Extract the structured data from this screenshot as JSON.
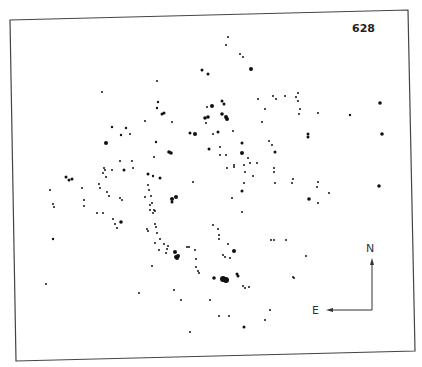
{
  "plate": {
    "number": "628"
  },
  "compass": {
    "north_label": "N",
    "east_label": "E"
  },
  "colors": {
    "ink": "#111111",
    "frame": "#444444",
    "background": "#ffffff"
  },
  "stars": [
    [
      228,
      37,
      1
    ],
    [
      226,
      45,
      1
    ],
    [
      240,
      54,
      1
    ],
    [
      243,
      57,
      1
    ],
    [
      251,
      69,
      2
    ],
    [
      202,
      70,
      1.5
    ],
    [
      208,
      74,
      1.5
    ],
    [
      157,
      81,
      1
    ],
    [
      102,
      92,
      1
    ],
    [
      158,
      102,
      1.2
    ],
    [
      157,
      108,
      1.2
    ],
    [
      162,
      114,
      1.5
    ],
    [
      164,
      113,
      1.5
    ],
    [
      145,
      121,
      1
    ],
    [
      172,
      122,
      1
    ],
    [
      212,
      106,
      2
    ],
    [
      222,
      101,
      1.5
    ],
    [
      224,
      104,
      1.5
    ],
    [
      207,
      107,
      1
    ],
    [
      208,
      117,
      1.8
    ],
    [
      205,
      118,
      1.8
    ],
    [
      222,
      114,
      1.8
    ],
    [
      226,
      117,
      2
    ],
    [
      227,
      119,
      2
    ],
    [
      206,
      123,
      1
    ],
    [
      218,
      132,
      1.5
    ],
    [
      190,
      133,
      1.5
    ],
    [
      195,
      134,
      2
    ],
    [
      213,
      134,
      1
    ],
    [
      233,
      131,
      1
    ],
    [
      242,
      143,
      1.5
    ],
    [
      258,
      99,
      1
    ],
    [
      265,
      109,
      1
    ],
    [
      262,
      122,
      1
    ],
    [
      273,
      96,
      1
    ],
    [
      276,
      99,
      1
    ],
    [
      156,
      142,
      1.2
    ],
    [
      154,
      157,
      1
    ],
    [
      171,
      153,
      1.8
    ],
    [
      169,
      152,
      1.8
    ],
    [
      209,
      149,
      1.5
    ],
    [
      220,
      147,
      1
    ],
    [
      220,
      155,
      1
    ],
    [
      226,
      155,
      1
    ],
    [
      242,
      153,
      2
    ],
    [
      248,
      158,
      1
    ],
    [
      250,
      163,
      1
    ],
    [
      234,
      167,
      1
    ],
    [
      275,
      152,
      1.5
    ],
    [
      274,
      168,
      1
    ],
    [
      269,
      141,
      1
    ],
    [
      272,
      145,
      1
    ],
    [
      112,
      127,
      1.2
    ],
    [
      126,
      128,
      1.2
    ],
    [
      121,
      135,
      1.2
    ],
    [
      130,
      134,
      1
    ],
    [
      106,
      143,
      2
    ],
    [
      120,
      161,
      1
    ],
    [
      132,
      161,
      1
    ],
    [
      133,
      168,
      1
    ],
    [
      105,
      170,
      1
    ],
    [
      112,
      170,
      1
    ],
    [
      124,
      170,
      1.5
    ],
    [
      106,
      177,
      1
    ],
    [
      66,
      177,
      1.5
    ],
    [
      69,
      180,
      1.5
    ],
    [
      72,
      179,
      1.5
    ],
    [
      148,
      174,
      1.5
    ],
    [
      50,
      190,
      1
    ],
    [
      53,
      204,
      1
    ],
    [
      54,
      207,
      1
    ],
    [
      82,
      188,
      1
    ],
    [
      84,
      200,
      1
    ],
    [
      84,
      206,
      1
    ],
    [
      99,
      184,
      1
    ],
    [
      100,
      188,
      1
    ],
    [
      103,
      173,
      1
    ],
    [
      104,
      168,
      1
    ],
    [
      107,
      192,
      1
    ],
    [
      109,
      196,
      1
    ],
    [
      97,
      213,
      1
    ],
    [
      103,
      213,
      1
    ],
    [
      120,
      198,
      1
    ],
    [
      122,
      200,
      1
    ],
    [
      121,
      222,
      1.8
    ],
    [
      117,
      228,
      1
    ],
    [
      148,
      185,
      1
    ],
    [
      149,
      190,
      1
    ],
    [
      145,
      197,
      1
    ],
    [
      150,
      205,
      1
    ],
    [
      150,
      210,
      1
    ],
    [
      153,
      213,
      1
    ],
    [
      154,
      210,
      1
    ],
    [
      53,
      239,
      1.2
    ],
    [
      113,
      219,
      1
    ],
    [
      115,
      224,
      1
    ],
    [
      153,
      176,
      1.2
    ],
    [
      160,
      178,
      1.5
    ],
    [
      151,
      196,
      1
    ],
    [
      152,
      203,
      1
    ],
    [
      155,
      211,
      1
    ],
    [
      155,
      224,
      1
    ],
    [
      172,
      199,
      2
    ],
    [
      176,
      197,
      2
    ],
    [
      172,
      202,
      1.5
    ],
    [
      147,
      229,
      1
    ],
    [
      148,
      231,
      1
    ],
    [
      155,
      243,
      1
    ],
    [
      156,
      227,
      1
    ],
    [
      157,
      233,
      1
    ],
    [
      160,
      239,
      1
    ],
    [
      159,
      250,
      1
    ],
    [
      167,
      249,
      1
    ],
    [
      175,
      252,
      2
    ],
    [
      176,
      257,
      2
    ],
    [
      187,
      247,
      1
    ],
    [
      195,
      250,
      1
    ],
    [
      213,
      225,
      1
    ],
    [
      218,
      229,
      1
    ],
    [
      219,
      239,
      1
    ],
    [
      219,
      235,
      1
    ],
    [
      228,
      244,
      1
    ],
    [
      223,
      255,
      1
    ],
    [
      225,
      257,
      1
    ],
    [
      234,
      165,
      1
    ],
    [
      227,
      168,
      1
    ],
    [
      244,
      165,
      1
    ],
    [
      245,
      172,
      1
    ],
    [
      253,
      176,
      1
    ],
    [
      257,
      163,
      1
    ],
    [
      274,
      172,
      1
    ],
    [
      275,
      183,
      1
    ],
    [
      244,
      183,
      1
    ],
    [
      242,
      191,
      1.5
    ],
    [
      232,
      198,
      1
    ],
    [
      242,
      212,
      1
    ],
    [
      286,
      240,
      1
    ],
    [
      193,
      182,
      1
    ],
    [
      164,
      244,
      1
    ],
    [
      168,
      246,
      1
    ],
    [
      166,
      253,
      1
    ],
    [
      177,
      258,
      2
    ],
    [
      178,
      256,
      2
    ],
    [
      189,
      247,
      1
    ],
    [
      152,
      266,
      1
    ],
    [
      196,
      259,
      1
    ],
    [
      196,
      267,
      1
    ],
    [
      198,
      271,
      1
    ],
    [
      199,
      273,
      1
    ],
    [
      214,
      278,
      1.8
    ],
    [
      223,
      279,
      3
    ],
    [
      226,
      280,
      3
    ],
    [
      234,
      251,
      2
    ],
    [
      230,
      258,
      1
    ],
    [
      237,
      274,
      1.5
    ],
    [
      238,
      276,
      1.5
    ],
    [
      243,
      286,
      1
    ],
    [
      245,
      288,
      1
    ],
    [
      249,
      287,
      1
    ],
    [
      274,
      240,
      1
    ],
    [
      294,
      278,
      1
    ],
    [
      174,
      290,
      1
    ],
    [
      181,
      300,
      1
    ],
    [
      210,
      300,
      1
    ],
    [
      219,
      316,
      1
    ],
    [
      229,
      316,
      1
    ],
    [
      270,
      310,
      1
    ],
    [
      265,
      320,
      1
    ],
    [
      244,
      327,
      1.5
    ],
    [
      190,
      332,
      1
    ],
    [
      46,
      284,
      1
    ],
    [
      139,
      293,
      1
    ],
    [
      285,
      96,
      1
    ],
    [
      298,
      93,
      1
    ],
    [
      296,
      97,
      1
    ],
    [
      298,
      101,
      1
    ],
    [
      300,
      109,
      1
    ],
    [
      299,
      114,
      1
    ],
    [
      318,
      113,
      1
    ],
    [
      350,
      115,
      1.2
    ],
    [
      380,
      103,
      1.8
    ],
    [
      382,
      134,
      1.8
    ],
    [
      308,
      134,
      1.5
    ],
    [
      308,
      137,
      1.5
    ],
    [
      293,
      179,
      1
    ],
    [
      292,
      183,
      1
    ],
    [
      318,
      182,
      1
    ],
    [
      317,
      187,
      1
    ],
    [
      329,
      193,
      1
    ],
    [
      379,
      186,
      1.8
    ],
    [
      309,
      199,
      1.8
    ],
    [
      318,
      203,
      1
    ],
    [
      271,
      240,
      1
    ],
    [
      306,
      256,
      1
    ],
    [
      293,
      277,
      1
    ]
  ]
}
